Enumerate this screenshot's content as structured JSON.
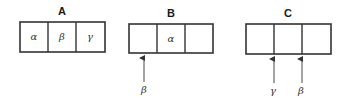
{
  "diagram": {
    "panels": [
      {
        "title": "A",
        "cells": [
          "α",
          "β",
          "γ"
        ],
        "arrows": []
      },
      {
        "title": "B",
        "cells": [
          "",
          "α",
          ""
        ],
        "arrows": [
          {
            "label": "β",
            "position": "under first cell"
          }
        ]
      },
      {
        "title": "C",
        "cells": [
          "",
          "",
          ""
        ],
        "arrows": [
          {
            "label": "γ",
            "position": "boundary between cell 1 and cell 2"
          },
          {
            "label": "β",
            "position": "boundary between cell 2 and cell 3"
          }
        ]
      }
    ],
    "colors": {
      "stroke": "#333333",
      "background": "#ffffff"
    }
  }
}
